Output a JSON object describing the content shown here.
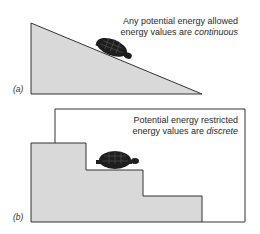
{
  "panel_a": {
    "label": "(a)",
    "caption_line1": "Any potential energy allowed",
    "caption_line2_prefix": "energy values are ",
    "caption_line2_emph": "continuous"
  },
  "panel_b": {
    "label": "(b)",
    "caption_line1": "Potential energy restricted",
    "caption_line2_prefix": "energy values are ",
    "caption_line2_emph": "discrete"
  },
  "colors": {
    "fill": "#d9d9d9",
    "stroke": "#333333",
    "turtle": "#1e1e1e"
  }
}
